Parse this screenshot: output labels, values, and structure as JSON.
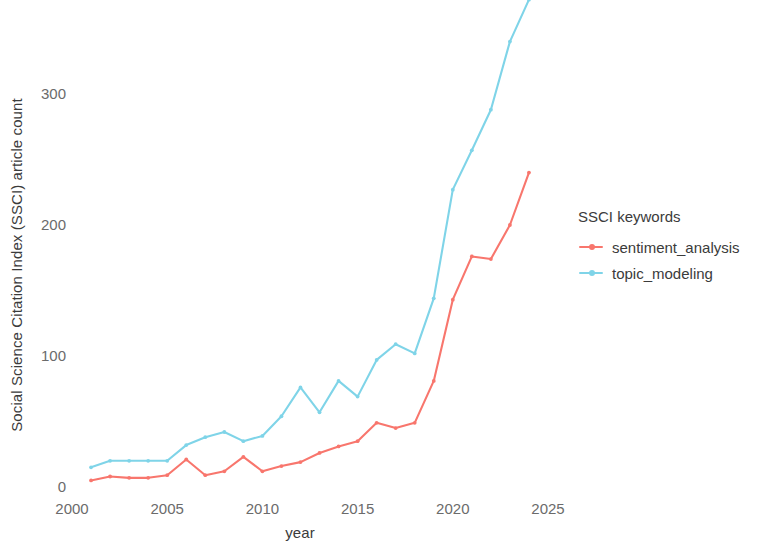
{
  "chart_data": {
    "type": "line",
    "title": "",
    "xlabel": "year",
    "ylabel": "Social Science Citation Index (SSCI) article count",
    "xlim": [
      2000,
      2026
    ],
    "ylim": [
      0,
      380
    ],
    "grid": false,
    "legend_position": "right",
    "legend_title": "SSCI keywords",
    "x_ticks": [
      "2000",
      "2005",
      "2010",
      "2015",
      "2020",
      "2025"
    ],
    "x_tick_values": [
      2000,
      2005,
      2010,
      2015,
      2020,
      2025
    ],
    "y_ticks": [
      "0",
      "100",
      "200",
      "300"
    ],
    "y_tick_values": [
      0,
      100,
      200,
      300
    ],
    "x": [
      2001,
      2002,
      2003,
      2004,
      2005,
      2006,
      2007,
      2008,
      2009,
      2010,
      2011,
      2012,
      2013,
      2014,
      2015,
      2016,
      2017,
      2018,
      2019,
      2020,
      2021,
      2022,
      2023,
      2024
    ],
    "series": [
      {
        "name": "sentiment_analysis",
        "color": "#F8766D",
        "values": [
          5,
          8,
          7,
          7,
          9,
          21,
          9,
          12,
          23,
          12,
          16,
          19,
          26,
          31,
          35,
          49,
          45,
          49,
          81,
          143,
          176,
          174,
          200,
          240
        ]
      },
      {
        "name": "topic_modeling",
        "color": "#7FD4E8",
        "values": [
          15,
          20,
          20,
          20,
          20,
          32,
          38,
          42,
          35,
          39,
          54,
          76,
          57,
          81,
          69,
          97,
          109,
          102,
          144,
          227,
          257,
          288,
          340,
          372
        ]
      }
    ]
  },
  "axes": {
    "y_title": "Social Science Citation Index (SSCI) article count",
    "x_title": "year"
  },
  "legend": {
    "title": "SSCI keywords",
    "items": [
      {
        "label": "sentiment_analysis",
        "color": "#F8766D"
      },
      {
        "label": "topic_modeling",
        "color": "#7FD4E8"
      }
    ]
  }
}
